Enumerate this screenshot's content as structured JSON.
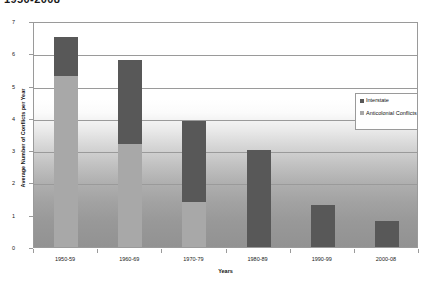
{
  "chart_data": {
    "type": "bar",
    "subtype": "stacked-column",
    "title": "1950-2008",
    "xlabel": "Years",
    "ylabel": "Average Number of Conflicts per Year",
    "categories": [
      "1950-59",
      "1960-69",
      "1970-79",
      "1980-89",
      "1990-99",
      "2000-08"
    ],
    "series": [
      {
        "name": "Anticolonial Conflicts",
        "color": "#a8a8a8",
        "values": [
          5.3,
          3.2,
          1.4,
          0,
          0,
          0
        ]
      },
      {
        "name": "Interstate",
        "color": "#585858",
        "values": [
          1.2,
          2.6,
          2.5,
          3.0,
          1.3,
          0.8
        ]
      }
    ],
    "totals": [
      6.5,
      5.8,
      3.9,
      3.0,
      1.3,
      0.8
    ],
    "ylim": [
      0,
      7
    ],
    "yticks": [
      "0",
      "1",
      "2",
      "3",
      "4",
      "5",
      "6",
      "7"
    ],
    "grid": true,
    "legend_position": "inside-right"
  },
  "legend": {
    "items": [
      {
        "label": "Interstate",
        "color": "#585858",
        "icon": "legend-swatch-square"
      },
      {
        "label": "Anticolonial Conflicts",
        "color": "#a8a8a8",
        "icon": "legend-swatch-square"
      }
    ]
  }
}
